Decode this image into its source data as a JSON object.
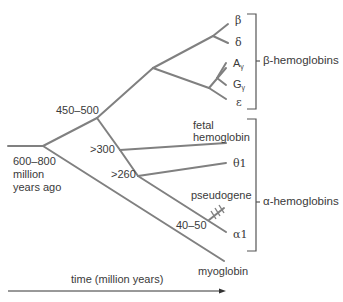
{
  "diagram": {
    "type": "phylogenetic-tree",
    "topic": "globin gene family evolution",
    "colors": {
      "branch": "#808080",
      "text": "#3a3a3a",
      "bracket": "#555555"
    },
    "node_labels": {
      "root": [
        "600–800",
        "million",
        "years ago"
      ],
      "alpha_beta_split": "450–500",
      "fetal_split": ">300",
      "theta_split": ">260",
      "pseudogene_split": "40–50"
    },
    "leaves": {
      "beta": "β",
      "delta": "δ",
      "a_gamma_main": "A",
      "a_gamma_sub": "γ",
      "g_gamma_main": "G",
      "g_gamma_sub": "γ",
      "epsilon": "ε",
      "fetal": [
        "fetal",
        "hemoglobin"
      ],
      "theta1": "θ1",
      "pseudogene": "pseudogene",
      "alpha1": "α1",
      "myoglobin": "myoglobin"
    },
    "groups": {
      "beta_group": "β-hemoglobins",
      "alpha_group": "α-hemoglobins"
    },
    "axis": {
      "label": "time (million years)"
    }
  }
}
